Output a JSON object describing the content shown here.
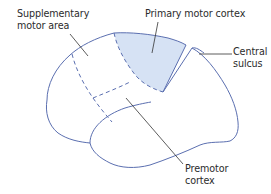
{
  "diagram": {
    "colors": {
      "outline": "#5b6fb0",
      "shading": "#d6e2f4",
      "leader": "#333333",
      "text": "#2b2b2b"
    },
    "labels": {
      "supplementary": {
        "line1": "Supplementary",
        "line2": "motor area"
      },
      "primary": {
        "line1": "Primary motor cortex"
      },
      "central": {
        "line1": "Central",
        "line2": "sulcus"
      },
      "premotor": {
        "line1": "Premotor",
        "line2": "cortex"
      }
    }
  }
}
